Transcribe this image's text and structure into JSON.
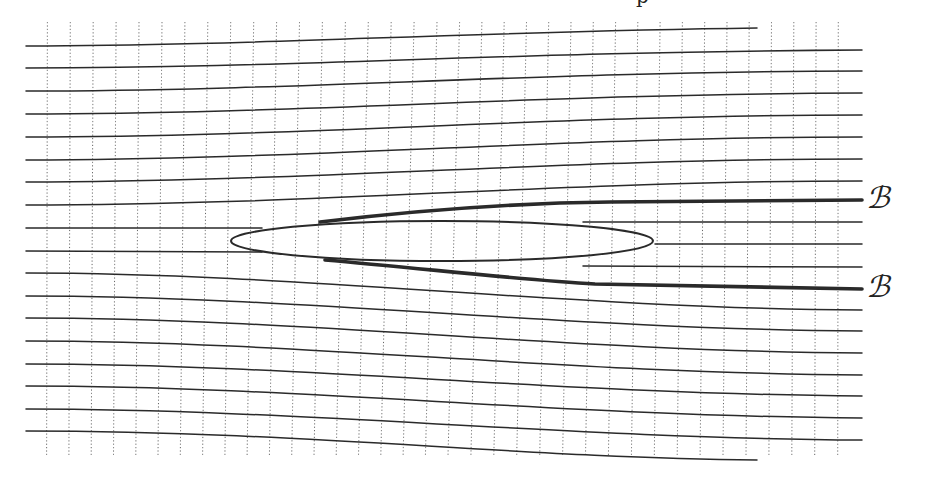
{
  "figure": {
    "colors": {
      "background": "#ffffff",
      "ink": "#2a2a2a",
      "grid": "#555555"
    },
    "cut_glyph": "p",
    "labels": [
      {
        "id": "upper",
        "text": "ℬ",
        "x": 866,
        "y": 183
      },
      {
        "id": "lower",
        "text": "ℬ",
        "x": 866,
        "y": 272
      }
    ],
    "ellipse": {
      "cx": 442,
      "cy": 241,
      "rx": 211,
      "ry": 20
    },
    "grid": {
      "vertical_x_start": 47,
      "vertical_spacing": 22.6,
      "vertical_count": 36,
      "y_top": 22,
      "y_bottom": 456
    },
    "streamlines": [
      {
        "d": "M26,46 C250,46 450,32 757,28",
        "bold": false
      },
      {
        "d": "M26,68 C300,68 500,52 862,50",
        "bold": false
      },
      {
        "d": "M26,91 C300,91 520,72 862,71",
        "bold": false
      },
      {
        "d": "M26,114 C300,114 540,94 862,93",
        "bold": false
      },
      {
        "d": "M26,137 C300,137 560,115 862,115",
        "bold": false
      },
      {
        "d": "M26,160 C300,160 560,137 862,137",
        "bold": false
      },
      {
        "d": "M26,182 C300,182 560,159 862,159",
        "bold": false
      },
      {
        "d": "M26,205 C320,205 560,181 862,181",
        "bold": false
      },
      {
        "d": "M26,228 L262,228",
        "bold": false
      },
      {
        "d": "M320,222 C420,210 520,203 610,202 L862,200",
        "bold": true
      },
      {
        "d": "M583,222 L862,222",
        "bold": false
      },
      {
        "d": "M655,244 L862,244",
        "bold": false
      },
      {
        "d": "M583,266 L862,267",
        "bold": false
      },
      {
        "d": "M325,260 C420,268 520,280 595,284 L862,289",
        "bold": true
      },
      {
        "d": "M26,251 L262,252",
        "bold": false
      },
      {
        "d": "M26,273 C300,273 560,308 862,310",
        "bold": false
      },
      {
        "d": "M26,296 C300,296 560,329 862,331",
        "bold": false
      },
      {
        "d": "M26,318 C300,318 560,351 862,353",
        "bold": false
      },
      {
        "d": "M26,341 C300,341 560,373 862,375",
        "bold": false
      },
      {
        "d": "M26,364 C300,364 560,394 862,396",
        "bold": false
      },
      {
        "d": "M26,386 C300,386 560,416 862,418",
        "bold": false
      },
      {
        "d": "M26,409 C300,409 560,438 862,440",
        "bold": false
      },
      {
        "d": "M26,431 C300,431 520,458 757,460",
        "bold": false
      }
    ]
  }
}
